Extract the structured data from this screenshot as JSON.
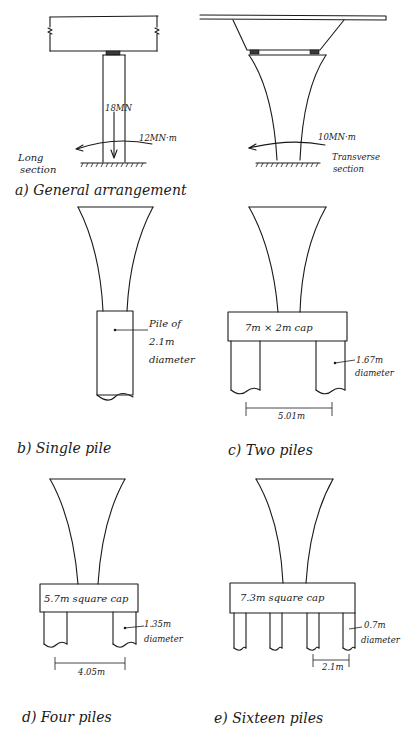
{
  "figure": {
    "panels": [
      {
        "id": "a",
        "caption": "a) General arrangement",
        "views": [
          {
            "name": "Long section",
            "label_line1": "Long",
            "label_line2": "section",
            "vertical_load": "18MN",
            "moment": "12MN·m"
          },
          {
            "name": "Transverse section",
            "label_line1": "Transverse",
            "label_line2": "section",
            "moment": "10MN·m"
          }
        ]
      },
      {
        "id": "b",
        "caption": "b) Single pile",
        "pile_label_line1": "Pile of",
        "pile_label_line2": "2.1m",
        "pile_label_line3": "diameter"
      },
      {
        "id": "c",
        "caption": "c) Two piles",
        "cap_label": "7m × 2m cap",
        "pile_diameter": "1.67m",
        "pile_diameter_word": "diameter",
        "spacing": "5.01m"
      },
      {
        "id": "d",
        "caption": "d) Four piles",
        "cap_label": "5.7m square cap",
        "pile_diameter": "1.35m",
        "pile_diameter_word": "diameter",
        "spacing": "4.05m"
      },
      {
        "id": "e",
        "caption": "e) Sixteen piles",
        "cap_label": "7.3m square cap",
        "pile_diameter": "0.7m",
        "pile_diameter_word": "diameter",
        "spacing": "2.1m"
      }
    ]
  }
}
